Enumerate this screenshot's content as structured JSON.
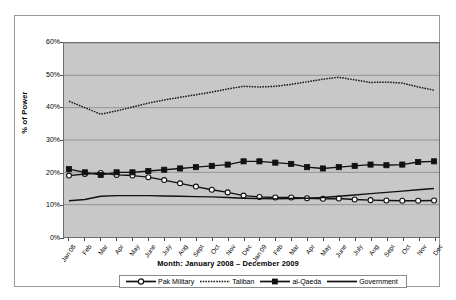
{
  "chart_data": {
    "type": "line",
    "title": "",
    "xlabel": "Month: January 2008 – December 2009",
    "ylabel": "% of Power",
    "ylim": [
      0,
      60
    ],
    "ytick_labels": [
      "60%",
      "50%",
      "40%",
      "30%",
      "20%",
      "10%",
      "0%"
    ],
    "ytick_values": [
      60,
      50,
      40,
      30,
      20,
      10,
      0
    ],
    "grid": true,
    "legend_position": "bottom",
    "plot_background": "#c8c8c8",
    "categories": [
      "Jan 08",
      "Feb",
      "Mar",
      "Apr",
      "May",
      "June",
      "July",
      "Aug",
      "Sept",
      "Oct",
      "Nov",
      "Dec",
      "Jan 09",
      "Feb",
      "Mar",
      "Apr",
      "May",
      "June",
      "July",
      "Aug",
      "Sept",
      "Oct",
      "Nov",
      "Dec"
    ],
    "series": [
      {
        "name": "Pak Military",
        "marker": "open-circle",
        "line_style": "solid",
        "color": "#111111",
        "values": [
          19.0,
          19.5,
          19.8,
          19.2,
          19.0,
          18.5,
          17.6,
          16.6,
          15.6,
          14.6,
          13.8,
          12.8,
          12.4,
          12.2,
          12.2,
          12.0,
          11.8,
          11.9,
          11.6,
          11.4,
          11.3,
          11.2,
          11.2,
          11.3
        ]
      },
      {
        "name": "Taliban",
        "marker": "none",
        "line_style": "dotted",
        "color": "#1a1a1a",
        "values": [
          42.0,
          40.0,
          38.0,
          39.0,
          40.2,
          41.4,
          42.4,
          43.2,
          44.0,
          44.8,
          45.8,
          46.6,
          46.4,
          46.6,
          47.2,
          48.0,
          48.8,
          49.4,
          48.6,
          47.8,
          47.9,
          47.6,
          46.4,
          45.4
        ]
      },
      {
        "name": "al-Qaeda",
        "marker": "filled-square",
        "line_style": "solid",
        "color": "#111111",
        "values": [
          21.0,
          20.0,
          19.2,
          20.0,
          20.0,
          20.4,
          20.8,
          21.2,
          21.6,
          22.0,
          22.4,
          23.4,
          23.4,
          23.0,
          22.6,
          21.6,
          21.2,
          21.6,
          22.0,
          22.4,
          22.2,
          22.4,
          23.2,
          23.4
        ]
      },
      {
        "name": "Government",
        "marker": "none",
        "line_style": "solid",
        "color": "#111111",
        "values": [
          11.2,
          11.6,
          12.6,
          12.8,
          12.8,
          12.8,
          12.7,
          12.6,
          12.5,
          12.4,
          12.2,
          12.0,
          11.9,
          11.8,
          11.9,
          12.0,
          12.2,
          12.6,
          13.0,
          13.4,
          13.8,
          14.2,
          14.6,
          15.0
        ]
      }
    ]
  }
}
